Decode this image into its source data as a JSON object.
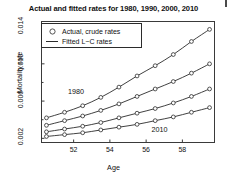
{
  "chart_data": {
    "type": "line",
    "title": "Actual and fitted rates for 1980, 1990, 2000, 2010",
    "xlabel": "Age",
    "ylabel": "Mortality rate",
    "xlim": [
      50.2,
      59.8
    ],
    "ylim": [
      0.0015,
      0.0146
    ],
    "grid": false,
    "xticks": [
      52,
      54,
      56,
      58
    ],
    "xtick_labels": [
      "52",
      "54",
      "56",
      "58"
    ],
    "yticks": [
      0.002,
      0.006,
      0.01,
      0.014
    ],
    "ytick_labels": [
      "0.002",
      "0.006",
      "0.010",
      "0.014"
    ],
    "x": [
      50.5,
      51.5,
      52.5,
      53.5,
      54.5,
      55.5,
      56.5,
      57.5,
      58.5,
      59.5
    ],
    "series": [
      {
        "name": "1980",
        "marker": "circle",
        "values": [
          0.0042,
          0.0048,
          0.0055,
          0.0064,
          0.0075,
          0.0087,
          0.0098,
          0.011,
          0.0124,
          0.0137
        ]
      },
      {
        "name": "1990",
        "marker": "circle",
        "values": [
          0.0034,
          0.0039,
          0.0044,
          0.005,
          0.0057,
          0.0065,
          0.0073,
          0.0081,
          0.009,
          0.01
        ]
      },
      {
        "name": "2000",
        "marker": "circle",
        "values": [
          0.0027,
          0.003,
          0.0033,
          0.0037,
          0.0042,
          0.0047,
          0.0052,
          0.0058,
          0.0065,
          0.0073
        ]
      },
      {
        "name": "2010",
        "marker": "circle",
        "values": [
          0.0022,
          0.0024,
          0.0026,
          0.0029,
          0.0032,
          0.0035,
          0.0039,
          0.0043,
          0.0048,
          0.0053
        ]
      }
    ],
    "annotations": [
      {
        "text": "1980",
        "x": 52.3,
        "y": 0.007
      },
      {
        "text": "2010",
        "x": 56.9,
        "y": 0.0029
      }
    ],
    "legend": {
      "position": "top-left",
      "entries": [
        {
          "label": "Actual, crude rates",
          "key": "circle-marker"
        },
        {
          "label": "Fitted L−C rates",
          "key": "line-segment"
        }
      ]
    },
    "colors": {
      "line": "#2b2b2b",
      "marker_edge": "#2b2b2b",
      "marker_fill": "#ffffff",
      "axis": "#3a3a3a",
      "text": "#111111",
      "background": "#ffffff"
    }
  }
}
